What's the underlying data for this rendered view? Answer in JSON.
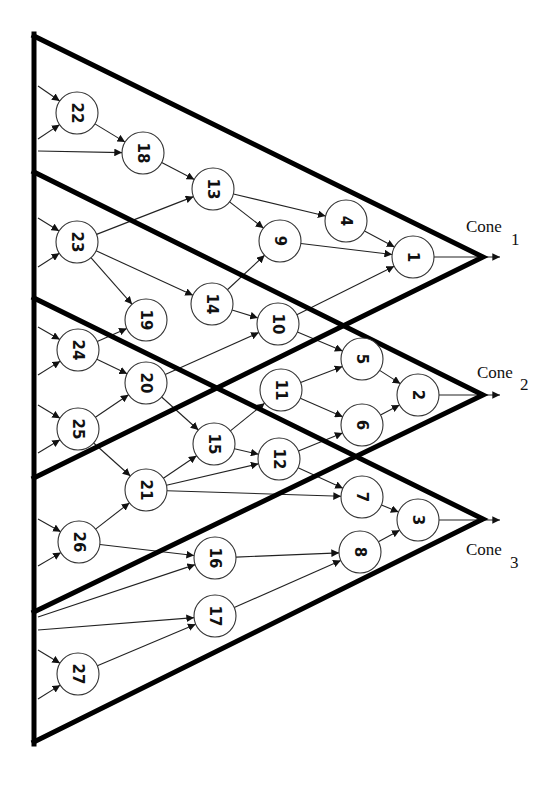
{
  "diagram": {
    "colors": {
      "cone_stroke": "#000000",
      "edge": "#222222",
      "node_fill": "#ffffff",
      "node_stroke": "#333333"
    },
    "cones": [
      {
        "id": "cone1",
        "label": "Cone",
        "sub": "1",
        "apex": [
          483,
          257
        ],
        "top": [
          34,
          36
        ],
        "bottom": [
          34,
          478
        ],
        "label_pos": [
          466,
          232
        ],
        "sub_pos": [
          511,
          245
        ]
      },
      {
        "id": "cone2",
        "label": "Cone",
        "sub": "2",
        "apex": [
          483,
          395
        ],
        "top": [
          34,
          172
        ],
        "bottom": [
          34,
          612
        ],
        "label_pos": [
          477,
          378
        ],
        "sub_pos": [
          520,
          390
        ]
      },
      {
        "id": "cone3",
        "label": "Cone",
        "sub": "3",
        "apex": [
          483,
          519
        ],
        "top": [
          34,
          298
        ],
        "bottom": [
          34,
          742
        ],
        "label_pos": [
          466,
          555
        ],
        "sub_pos": [
          510,
          568
        ]
      }
    ],
    "nodes": [
      {
        "id": "1",
        "x": 413,
        "y": 257
      },
      {
        "id": "2",
        "x": 418,
        "y": 395
      },
      {
        "id": "3",
        "x": 418,
        "y": 520
      },
      {
        "id": "4",
        "x": 346,
        "y": 221
      },
      {
        "id": "5",
        "x": 362,
        "y": 359
      },
      {
        "id": "6",
        "x": 362,
        "y": 425
      },
      {
        "id": "7",
        "x": 362,
        "y": 497
      },
      {
        "id": "8",
        "x": 360,
        "y": 552
      },
      {
        "id": "9",
        "x": 280,
        "y": 241
      },
      {
        "id": "10",
        "x": 278,
        "y": 324
      },
      {
        "id": "11",
        "x": 281,
        "y": 390
      },
      {
        "id": "12",
        "x": 279,
        "y": 459
      },
      {
        "id": "13",
        "x": 213,
        "y": 189
      },
      {
        "id": "14",
        "x": 212,
        "y": 304
      },
      {
        "id": "15",
        "x": 214,
        "y": 444
      },
      {
        "id": "16",
        "x": 215,
        "y": 558
      },
      {
        "id": "17",
        "x": 215,
        "y": 616
      },
      {
        "id": "18",
        "x": 143,
        "y": 153
      },
      {
        "id": "19",
        "x": 146,
        "y": 320
      },
      {
        "id": "20",
        "x": 146,
        "y": 383
      },
      {
        "id": "21",
        "x": 146,
        "y": 490
      },
      {
        "id": "22",
        "x": 77,
        "y": 113
      },
      {
        "id": "23",
        "x": 77,
        "y": 242
      },
      {
        "id": "24",
        "x": 78,
        "y": 350
      },
      {
        "id": "25",
        "x": 78,
        "y": 429
      },
      {
        "id": "26",
        "x": 79,
        "y": 542
      },
      {
        "id": "27",
        "x": 78,
        "y": 674
      }
    ],
    "edges": [
      [
        "22",
        "18"
      ],
      [
        "18",
        "13"
      ],
      [
        "13",
        "4"
      ],
      [
        "13",
        "9"
      ],
      [
        "4",
        "1"
      ],
      [
        "9",
        "1"
      ],
      [
        "23",
        "13"
      ],
      [
        "23",
        "14"
      ],
      [
        "23",
        "19"
      ],
      [
        "14",
        "9"
      ],
      [
        "14",
        "10"
      ],
      [
        "10",
        "1"
      ],
      [
        "10",
        "5"
      ],
      [
        "24",
        "19"
      ],
      [
        "24",
        "20"
      ],
      [
        "20",
        "10"
      ],
      [
        "20",
        "15"
      ],
      [
        "25",
        "20"
      ],
      [
        "25",
        "21"
      ],
      [
        "15",
        "11"
      ],
      [
        "15",
        "12"
      ],
      [
        "11",
        "5"
      ],
      [
        "11",
        "6"
      ],
      [
        "5",
        "2"
      ],
      [
        "6",
        "2"
      ],
      [
        "21",
        "15"
      ],
      [
        "21",
        "12"
      ],
      [
        "21",
        "7"
      ],
      [
        "12",
        "6"
      ],
      [
        "12",
        "7"
      ],
      [
        "7",
        "3"
      ],
      [
        "26",
        "21"
      ],
      [
        "26",
        "16"
      ],
      [
        "16",
        "8"
      ],
      [
        "17",
        "8"
      ],
      [
        "8",
        "3"
      ],
      [
        "27",
        "17"
      ]
    ],
    "input_edges": [
      {
        "from": [
          38,
          86
        ],
        "to": "22"
      },
      {
        "from": [
          38,
          139
        ],
        "to": "22"
      },
      {
        "from": [
          38,
          151
        ],
        "to": "18"
      },
      {
        "from": [
          38,
          218
        ],
        "to": "23"
      },
      {
        "from": [
          38,
          267
        ],
        "to": "23"
      },
      {
        "from": [
          38,
          327
        ],
        "to": "24"
      },
      {
        "from": [
          38,
          375
        ],
        "to": "24"
      },
      {
        "from": [
          38,
          405
        ],
        "to": "25"
      },
      {
        "from": [
          38,
          453
        ],
        "to": "25"
      },
      {
        "from": [
          38,
          519
        ],
        "to": "26"
      },
      {
        "from": [
          38,
          566
        ],
        "to": "26"
      },
      {
        "from": [
          38,
          617
        ],
        "to": "16"
      },
      {
        "from": [
          38,
          630
        ],
        "to": "17"
      },
      {
        "from": [
          38,
          650
        ],
        "to": "27"
      },
      {
        "from": [
          38,
          699
        ],
        "to": "27"
      }
    ],
    "output_edges": [
      {
        "from": "1",
        "to": [
          500,
          257
        ]
      },
      {
        "from": "2",
        "to": [
          500,
          395
        ]
      },
      {
        "from": "3",
        "to": [
          500,
          520
        ]
      }
    ],
    "node_radius": 21
  }
}
